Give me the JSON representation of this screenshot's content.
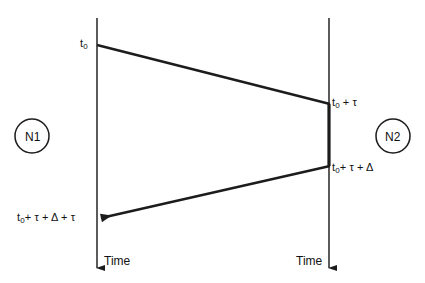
{
  "diagram": {
    "type": "message-sequence-timing-diagram",
    "background_color": "#ffffff",
    "line_color": "#2b2b2b",
    "text_color": "#111111",
    "nodes": [
      {
        "id": "n1",
        "label": "N1",
        "side": "left"
      },
      {
        "id": "n2",
        "label": "N2",
        "side": "right"
      }
    ],
    "timeline_axis_labels": [
      {
        "id": "time-left",
        "label": "Time",
        "side": "left"
      },
      {
        "id": "time-right",
        "label": "Time",
        "side": "right"
      }
    ],
    "event_labels": {
      "t0": {
        "base": "t",
        "sub": "0",
        "rest": ""
      },
      "t0_plus_tau": {
        "base": "t",
        "sub": "0",
        "rest": " + τ"
      },
      "t0_plus_tau_plus_delta": {
        "base": "t",
        "sub": "0",
        "rest": "+ τ + Δ"
      },
      "t0_plus_tau_plus_delta_plus_tau": {
        "base": "t",
        "sub": "0",
        "rest": "+ τ + Δ + τ"
      }
    },
    "messages": [
      {
        "id": "request",
        "from": "n1",
        "to": "n2",
        "send_label": "t0",
        "receive_label": "t0_plus_tau",
        "direction": "left-to-right",
        "arrowhead": false
      },
      {
        "id": "response",
        "from": "n2",
        "to": "n1",
        "send_label": "t0_plus_tau_plus_delta",
        "receive_label": "t0_plus_tau_plus_delta_plus_tau",
        "direction": "right-to-left",
        "arrowhead": true
      }
    ],
    "processing_segment": {
      "id": "n2-processing",
      "on": "n2",
      "start_label": "t0_plus_tau",
      "end_label": "t0_plus_tau_plus_delta",
      "emphasis": "bold"
    }
  }
}
